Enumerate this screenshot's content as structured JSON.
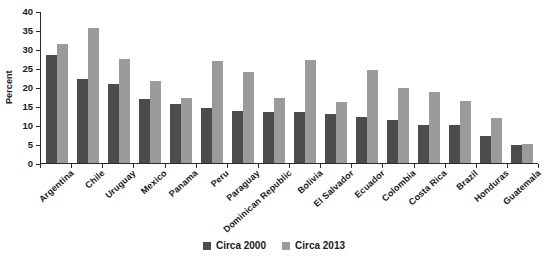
{
  "chart_data": {
    "type": "bar",
    "title": "",
    "xlabel": "",
    "ylabel": "Percent",
    "ylim": [
      0,
      40
    ],
    "yticks": [
      0,
      5,
      10,
      15,
      20,
      25,
      30,
      35,
      40
    ],
    "grid": false,
    "legend_position": "bottom-center",
    "categories": [
      "Argentina",
      "Chile",
      "Uruguay",
      "Mexico",
      "Panama",
      "Peru",
      "Paraguay",
      "Dominican Republic",
      "Bolivia",
      "El Salvador",
      "Ecuador",
      "Colombia",
      "Costa Rica",
      "Brazil",
      "Honduras",
      "Guatemala"
    ],
    "series": [
      {
        "name": "Circa 2000",
        "color": "#4c4c4c",
        "values": [
          28.3,
          22.1,
          20.9,
          16.8,
          15.6,
          14.4,
          13.8,
          13.4,
          13.3,
          12.8,
          12.2,
          11.3,
          10.1,
          10.0,
          7.2,
          4.8
        ]
      },
      {
        "name": "Circa 2013",
        "color": "#9b9b9b",
        "values": [
          31.4,
          35.4,
          27.4,
          21.5,
          17.1,
          26.8,
          24.0,
          17.0,
          27.2,
          16.0,
          24.4,
          19.8,
          18.6,
          16.4,
          11.8,
          5.1
        ]
      }
    ]
  },
  "legend": {
    "items": [
      {
        "label": "Circa 2000",
        "color": "#4c4c4c"
      },
      {
        "label": "Circa 2013",
        "color": "#9b9b9b"
      }
    ]
  }
}
